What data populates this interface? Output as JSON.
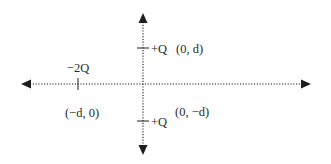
{
  "diagram": {
    "type": "coordinate-axes-charge-configuration",
    "colors": {
      "ink": "#1e1e1e",
      "text": "#2b2b2b",
      "background": "#ffffff"
    },
    "axes": {
      "x_axis": {
        "style": "dotted",
        "arrows": "both"
      },
      "y_axis": {
        "style": "dotted",
        "arrows": "both"
      }
    },
    "charges": [
      {
        "id": "charge-left",
        "label": "−2Q",
        "coord_label": "(−d, 0)"
      },
      {
        "id": "charge-top",
        "label": "+Q",
        "coord_label": "(0, d)"
      },
      {
        "id": "charge-bottom",
        "label": "+Q",
        "coord_label": "(0, −d)"
      }
    ]
  }
}
